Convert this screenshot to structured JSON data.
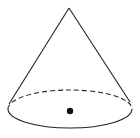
{
  "diagram": {
    "shape": "cone",
    "apex": {
      "x": 69,
      "y": 8
    },
    "base": {
      "cx": 70,
      "cy": 109,
      "rx": 62,
      "ry": 19
    },
    "center_point": {
      "x": 70,
      "y": 111,
      "r": 3.2
    },
    "stroke_color": "#222222",
    "fill_color": "#ffffff",
    "hidden_edge_style": "dashed"
  }
}
